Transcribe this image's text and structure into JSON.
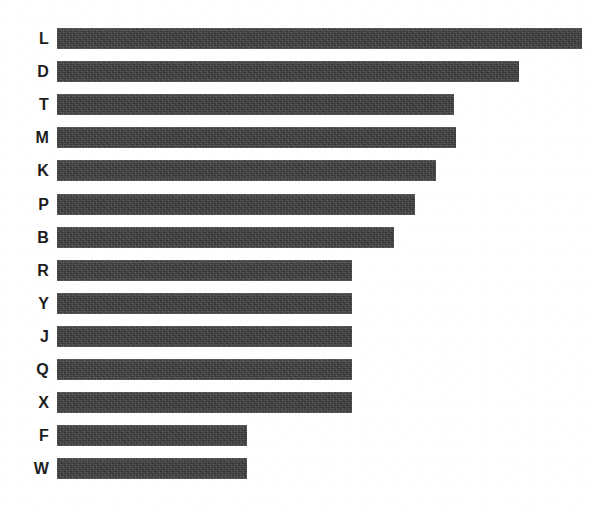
{
  "chart_data": {
    "type": "bar",
    "orientation": "horizontal",
    "title": "",
    "subtitle": "",
    "xlabel": "",
    "ylabel": "",
    "grid": false,
    "legend": false,
    "axis_visible": false,
    "tick_labels_x": [],
    "categories": [
      "L",
      "D",
      "T",
      "M",
      "K",
      "P",
      "B",
      "R",
      "Y",
      "J",
      "Q",
      "X",
      "F",
      "W"
    ],
    "values": [
      525,
      462,
      397,
      399,
      379,
      358,
      337,
      295,
      295,
      295,
      295,
      295,
      190,
      190
    ],
    "xlim": [
      0,
      525
    ],
    "sorted": "descending",
    "bar_color": "#3d3d3d",
    "background_color": "#ffffff",
    "label_color": "#1d1d1d"
  },
  "chart": {
    "bars": [
      {
        "label": "L",
        "value": 525
      },
      {
        "label": "D",
        "value": 462
      },
      {
        "label": "T",
        "value": 397
      },
      {
        "label": "M",
        "value": 399
      },
      {
        "label": "K",
        "value": 379
      },
      {
        "label": "P",
        "value": 358
      },
      {
        "label": "B",
        "value": 337
      },
      {
        "label": "R",
        "value": 295
      },
      {
        "label": "Y",
        "value": 295
      },
      {
        "label": "J",
        "value": 295
      },
      {
        "label": "Q",
        "value": 295
      },
      {
        "label": "X",
        "value": 295
      },
      {
        "label": "F",
        "value": 190
      },
      {
        "label": "W",
        "value": 190
      }
    ],
    "layout": {
      "bar_origin_x": 57,
      "first_bar_top": 28,
      "bar_height": 21,
      "bar_pitch": 33.1,
      "label_right_edge": 49,
      "max_value": 525,
      "max_bar_width_px": 525
    }
  }
}
